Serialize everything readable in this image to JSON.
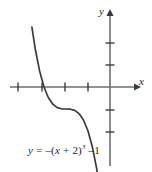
{
  "figure": {
    "name": "cubic-function-graph",
    "background_color": "#ffffff",
    "axis_color": "#6d6e71",
    "curve_color": "#3b3b3b",
    "text_color": "#231f20"
  },
  "axes": {
    "x_axis_label": "x",
    "y_axis_label": "y",
    "x_ticks": [
      -4,
      -3,
      -1,
      0
    ],
    "y_ticks": [
      -3,
      -2,
      1,
      2
    ],
    "origin_px": {
      "x": 110,
      "y": 87
    },
    "unit_px": 22
  },
  "caption": {
    "y_symbol": "y",
    "equals": " = ",
    "minus": "–",
    "open_paren": "(",
    "x_symbol": "x",
    "plus": " + ",
    "two": "2",
    "close_paren": ")",
    "exponent": "3",
    "tail": " –1",
    "full_text": "y = –(x + 2)³ –1"
  },
  "chart_data": {
    "type": "line",
    "title": "",
    "xlabel": "x",
    "ylabel": "y",
    "equation": "y = -(x + 2)^3 - 1",
    "xlim": [
      -4.8,
      1.6
    ],
    "ylim": [
      -3.8,
      3.6
    ],
    "grid": false,
    "legend": "none",
    "xticks": [
      -4,
      -3,
      -1,
      0
    ],
    "yticks": [
      -3,
      -2,
      1,
      2
    ],
    "annotations": [
      "y = –(x + 2)³ –1"
    ],
    "series": [
      {
        "name": "y = -(x + 2)^3 - 1",
        "x": [
          -3.55,
          -3.4,
          -3.2,
          -3.0,
          -2.8,
          -2.6,
          -2.4,
          -2.2,
          -2.0,
          -1.8,
          -1.6,
          -1.4,
          -1.2,
          -1.0,
          -0.8,
          -0.6,
          -0.45
        ],
        "values": [
          2.72,
          1.74,
          0.73,
          0.0,
          -0.49,
          -0.78,
          -0.94,
          -0.99,
          -1.0,
          -1.01,
          -1.06,
          -1.22,
          -1.51,
          -2.0,
          -2.73,
          -3.74,
          -4.74
        ]
      }
    ]
  }
}
